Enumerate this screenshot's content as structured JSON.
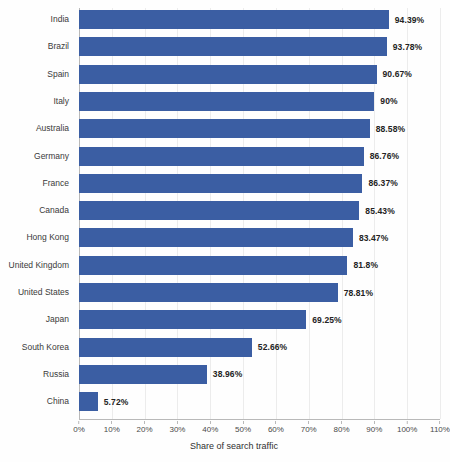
{
  "chart_data": {
    "type": "bar",
    "orientation": "horizontal",
    "title": "",
    "subtitle": "",
    "xlabel": "Share of search traffic",
    "ylabel": "",
    "xlim": [
      0,
      110
    ],
    "grid": true,
    "legend": false,
    "value_suffix": "%",
    "categories": [
      "India",
      "Brazil",
      "Spain",
      "Italy",
      "Australia",
      "Germany",
      "France",
      "Canada",
      "Hong Kong",
      "United Kingdom",
      "United States",
      "Japan",
      "South Korea",
      "Russia",
      "China"
    ],
    "values": [
      94.39,
      93.78,
      90.67,
      90,
      88.58,
      86.76,
      86.37,
      85.43,
      83.47,
      81.8,
      78.81,
      69.25,
      52.66,
      38.96,
      5.72
    ],
    "value_labels": [
      "94.39%",
      "93.78%",
      "90.67%",
      "90%",
      "88.58%",
      "86.76%",
      "86.37%",
      "85.43%",
      "83.47%",
      "81.8%",
      "78.81%",
      "69.25%",
      "52.66%",
      "38.96%",
      "5.72%"
    ],
    "xticks": [
      0,
      10,
      20,
      30,
      40,
      50,
      60,
      70,
      80,
      90,
      100,
      110
    ],
    "xtick_labels": [
      "0%",
      "10%",
      "20%",
      "30%",
      "40%",
      "50%",
      "60%",
      "70%",
      "80%",
      "90%",
      "100%",
      "110%"
    ],
    "colors": {
      "bar": "#3b5ea3",
      "background": "#fefefe",
      "grid": "#ececec",
      "axis": "#b9b9b9",
      "text": "#2b2b2b"
    }
  }
}
